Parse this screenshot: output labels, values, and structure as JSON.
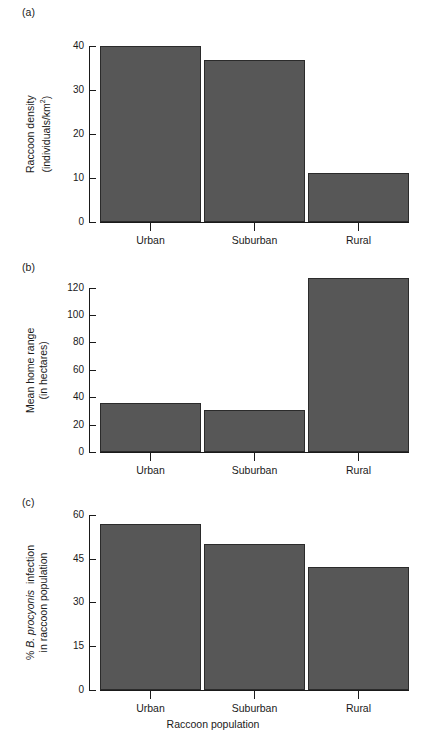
{
  "figure": {
    "panels": [
      {
        "tag": "(a)",
        "ylabel_line1": "Raccoon density",
        "ylabel_line2": "(individuals/km²)",
        "yticks": [
          "0",
          "10",
          "20",
          "30",
          "40"
        ],
        "xticks": [
          "Urban",
          "Suburban",
          "Rural"
        ]
      },
      {
        "tag": "(b)",
        "ylabel_line1": "Mean home range",
        "ylabel_line2": "(in hectares)",
        "yticks": [
          "0",
          "20",
          "40",
          "60",
          "80",
          "100",
          "120"
        ],
        "xticks": [
          "Urban",
          "Suburban",
          "Rural"
        ]
      },
      {
        "tag": "(c)",
        "ylabel_line1": "% B. procyonis  infection",
        "ylabel_line2": "in raccoon population",
        "yticks": [
          "0",
          "15",
          "30",
          "45",
          "60"
        ],
        "xticks": [
          "Urban",
          "Suburban",
          "Rural"
        ]
      }
    ],
    "xtitle": "Raccoon population",
    "bar_fill": "#575757",
    "bar_stroke": "#2b2b2b",
    "background": "#ffffff"
  },
  "chart_data": [
    {
      "type": "bar",
      "panel": "(a)",
      "title": "",
      "categories": [
        "Urban",
        "Suburban",
        "Rural"
      ],
      "values": [
        40,
        37,
        11
      ],
      "xlabel": "",
      "ylabel": "Raccoon density (individuals/km2)",
      "ylim": [
        0,
        40
      ],
      "yticks": [
        0,
        10,
        20,
        30,
        40
      ],
      "grid": false,
      "legend": "none"
    },
    {
      "type": "bar",
      "panel": "(b)",
      "title": "",
      "categories": [
        "Urban",
        "Suburban",
        "Rural"
      ],
      "values": [
        39,
        33,
        127
      ],
      "xlabel": "",
      "ylabel": "Mean home range (in hectares)",
      "ylim": [
        0,
        120
      ],
      "yticks": [
        0,
        20,
        40,
        60,
        80,
        100,
        120
      ],
      "grid": false,
      "legend": "none",
      "note": "Rural bar extends above the topmost axis tick (120)"
    },
    {
      "type": "bar",
      "panel": "(c)",
      "title": "",
      "categories": [
        "Urban",
        "Suburban",
        "Rural"
      ],
      "values": [
        57,
        50,
        42
      ],
      "xlabel": "Raccoon population",
      "ylabel": "% B. procyonis infection in raccoon population",
      "ylim": [
        0,
        60
      ],
      "yticks": [
        0,
        15,
        30,
        45,
        60
      ],
      "grid": false,
      "legend": "none"
    }
  ]
}
